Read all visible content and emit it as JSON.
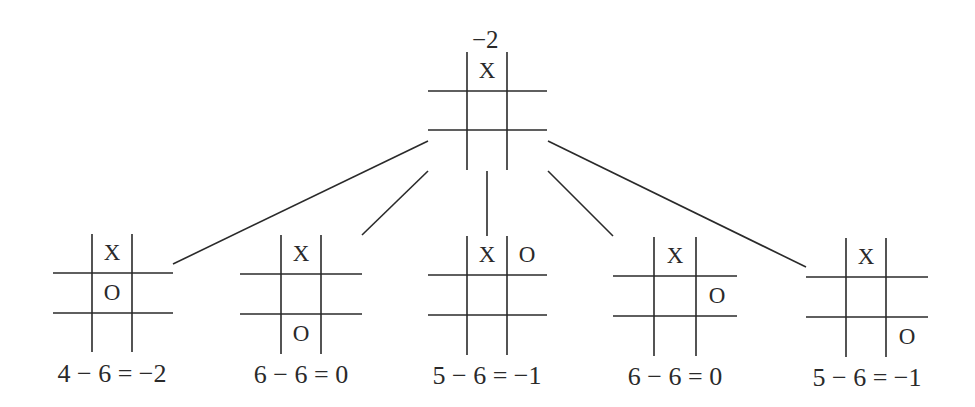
{
  "diagram": {
    "type": "game-tree",
    "root": {
      "score": "−2",
      "board": [
        "",
        "X",
        "",
        "",
        "",
        "",
        "",
        "",
        ""
      ]
    },
    "children": [
      {
        "board": [
          "",
          "X",
          "",
          "",
          "O",
          "",
          "",
          "",
          ""
        ],
        "label": "4 − 6 = −2"
      },
      {
        "board": [
          "",
          "X",
          "",
          "",
          "",
          "",
          "",
          "O",
          ""
        ],
        "label": "6 − 6 = 0"
      },
      {
        "board": [
          "",
          "X",
          "O",
          "",
          "",
          "",
          "",
          "",
          ""
        ],
        "label": "5 − 6 = −1"
      },
      {
        "board": [
          "",
          "X",
          "",
          "",
          "",
          "O",
          "",
          "",
          ""
        ],
        "label": "6 − 6 = 0"
      },
      {
        "board": [
          "",
          "X",
          "",
          "",
          "",
          "",
          "",
          "",
          "O"
        ],
        "label": "5 − 6 = −1"
      }
    ],
    "line_color": "#2a2a2a"
  }
}
